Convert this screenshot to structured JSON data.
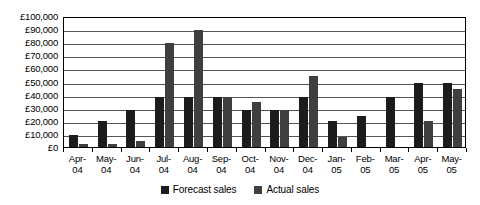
{
  "chart_data": {
    "type": "bar",
    "title": "",
    "subtitle": "",
    "xlabel": "",
    "ylabel": "",
    "ylim": [
      0,
      100000
    ],
    "ytick_step": 10000,
    "grid": true,
    "legend_position": "bottom-center",
    "currency_symbol": "£",
    "categories": [
      "Apr-04",
      "May-04",
      "Jun-04",
      "Jul-04",
      "Aug-04",
      "Sep-04",
      "Oct-04",
      "Nov-04",
      "Dec-04",
      "Jan-05",
      "Feb-05",
      "Mar-05",
      "Apr-05",
      "May-05"
    ],
    "category_lines": [
      [
        "Apr-",
        "04"
      ],
      [
        "May-",
        "04"
      ],
      [
        "Jun-",
        "04"
      ],
      [
        "Jul-",
        "04"
      ],
      [
        "Aug-",
        "04"
      ],
      [
        "Sep-",
        "04"
      ],
      [
        "Oct-",
        "04"
      ],
      [
        "Nov-",
        "04"
      ],
      [
        "Dec-",
        "04"
      ],
      [
        "Jan-",
        "05"
      ],
      [
        "Feb-",
        "05"
      ],
      [
        "Mar-",
        "05"
      ],
      [
        "Apr-",
        "05"
      ],
      [
        "May-",
        "05"
      ]
    ],
    "ytick_labels": [
      "£100,000",
      "£90,000",
      "£80,000",
      "£70,000",
      "£60,000",
      "£50,000",
      "£40,000",
      "£30,000",
      "£20,000",
      "£10,000",
      "£0"
    ],
    "ytick_values": [
      100000,
      90000,
      80000,
      70000,
      60000,
      50000,
      40000,
      30000,
      20000,
      10000,
      0
    ],
    "series": [
      {
        "name": "Forecast sales",
        "color": "#1c1c1c",
        "values": [
          9500,
          19500,
          28500,
          38500,
          38500,
          38500,
          28500,
          28500,
          38500,
          19500,
          24000,
          38500,
          48500,
          48500
        ]
      },
      {
        "name": "Actual sales",
        "color": "#3f3f3f",
        "values": [
          2000,
          2000,
          4500,
          79500,
          89000,
          38500,
          34000,
          28500,
          54000,
          7500,
          0,
          0,
          19500,
          44000
        ]
      }
    ]
  },
  "legend": {
    "entries": [
      {
        "label": "Forecast sales",
        "color": "#1c1c1c"
      },
      {
        "label": "Actual sales",
        "color": "#3f3f3f"
      }
    ]
  }
}
